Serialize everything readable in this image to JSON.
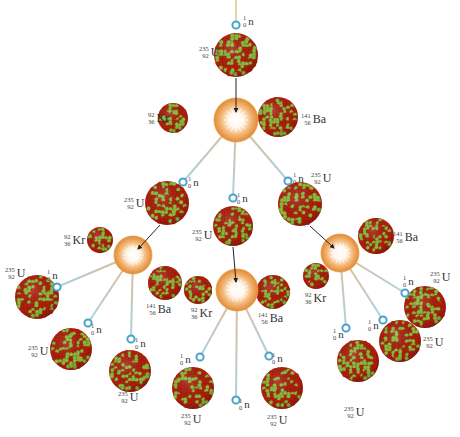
{
  "diagram": {
    "colors": {
      "nucleus_red": "#b3200f",
      "nucleus_green": "#8cbf3f",
      "flash_outer": "#e89a45",
      "flash_inner": "#ffffff",
      "neutron": "#4aa3c8",
      "neutron_track": "#a9d3e6",
      "fragment_track": "#e6b98a",
      "arrow": "#222222",
      "label": "#333333"
    },
    "isotopes": {
      "uranium": {
        "mass": "235",
        "atomic": "92",
        "symbol": "U"
      },
      "krypton": {
        "mass": "92",
        "atomic": "36",
        "symbol": "Kr"
      },
      "barium": {
        "mass": "141",
        "atomic": "56",
        "symbol": "Ba"
      },
      "neutron": {
        "mass": "1",
        "atomic": "0",
        "symbol": "n"
      }
    },
    "generations": [
      {
        "level": 1,
        "neutrons_in": 1,
        "fissions": 1,
        "neutrons_out": 3
      },
      {
        "level": 2,
        "fissions": 3,
        "neutrons_out": 9
      }
    ],
    "labels": {
      "top_neutron": {
        "mass": "1",
        "atomic": "0",
        "symbol": "n"
      },
      "top_uranium": {
        "mass": "235",
        "atomic": "92",
        "symbol": "U"
      },
      "top_kr": {
        "mass": "92",
        "atomic": "36",
        "symbol": "Kr"
      },
      "top_ba": {
        "mass": "141",
        "atomic": "56",
        "symbol": "Ba"
      },
      "l2_left_n": {
        "mass": "1",
        "atomic": "0",
        "symbol": "n"
      },
      "l2_left_u": {
        "mass": "235",
        "atomic": "92",
        "symbol": "U"
      },
      "l2_mid_n": {
        "mass": "1",
        "atomic": "0",
        "symbol": "n"
      },
      "l2_mid_u": {
        "mass": "235",
        "atomic": "92",
        "symbol": "U"
      },
      "l2_right_n": {
        "mass": "1",
        "atomic": "0",
        "symbol": "n"
      },
      "l2_right_u": {
        "mass": "235",
        "atomic": "92",
        "symbol": "U"
      },
      "left_kr": {
        "mass": "92",
        "atomic": "36",
        "symbol": "Kr"
      },
      "left_ba": {
        "mass": "141",
        "atomic": "56",
        "symbol": "Ba"
      },
      "mid_kr": {
        "mass": "92",
        "atomic": "36",
        "symbol": "Kr"
      },
      "mid_ba": {
        "mass": "141",
        "atomic": "56",
        "symbol": "Ba"
      },
      "right_kr": {
        "mass": "92",
        "atomic": "36",
        "symbol": "Kr"
      },
      "right_ba": {
        "mass": "141",
        "atomic": "56",
        "symbol": "Ba"
      },
      "l3_a_u": {
        "mass": "235",
        "atomic": "92",
        "symbol": "U"
      },
      "l3_a_n": {
        "mass": "1",
        "atomic": "0",
        "symbol": "n"
      },
      "l3_b_u": {
        "mass": "235",
        "atomic": "92",
        "symbol": "U"
      },
      "l3_b_n": {
        "mass": "1",
        "atomic": "0",
        "symbol": "n"
      },
      "l3_c_u": {
        "mass": "235",
        "atomic": "92",
        "symbol": "U"
      },
      "l3_c_n": {
        "mass": "1",
        "atomic": "0",
        "symbol": "n"
      },
      "l3_d_u": {
        "mass": "235",
        "atomic": "92",
        "symbol": "U"
      },
      "l3_d_n": {
        "mass": "1",
        "atomic": "0",
        "symbol": "n"
      },
      "l3_e_n": {
        "mass": "1",
        "atomic": "0",
        "symbol": "n"
      },
      "l3_f_u": {
        "mass": "235",
        "atomic": "92",
        "symbol": "U"
      },
      "l3_f_n": {
        "mass": "1",
        "atomic": "0",
        "symbol": "n"
      },
      "l3_g_u": {
        "mass": "235",
        "atomic": "92",
        "symbol": "U"
      },
      "l3_g_n": {
        "mass": "1",
        "atomic": "0",
        "symbol": "n"
      },
      "l3_h_u": {
        "mass": "235",
        "atomic": "92",
        "symbol": "U"
      },
      "l3_h_n": {
        "mass": "1",
        "atomic": "0",
        "symbol": "n"
      },
      "l3_i_u": {
        "mass": "235",
        "atomic": "92",
        "symbol": "U"
      },
      "l3_i_n": {
        "mass": "1",
        "atomic": "0",
        "symbol": "n"
      }
    }
  }
}
